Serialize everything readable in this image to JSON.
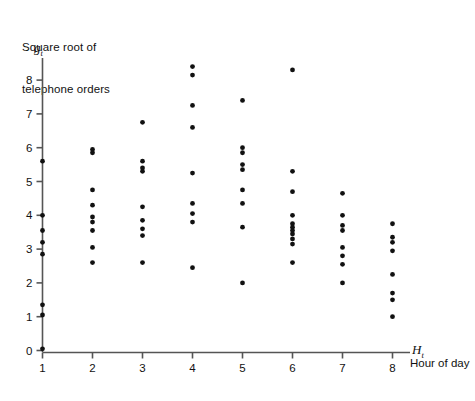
{
  "figure": {
    "ylabel_lines": [
      "Square root of",
      "telephone orders"
    ],
    "y_symbol": "g",
    "y_symbol_sub": "t",
    "x_symbol": "H",
    "x_symbol_sub": "t",
    "xlabel": "Hour of day",
    "point_color": "#111111",
    "axis_color": "#555555"
  },
  "chart_data": {
    "type": "scatter",
    "title": "",
    "xlabel": "Hour of day",
    "ylabel": "Square root of telephone orders",
    "x_symbol": "H_t",
    "y_symbol": "g_t",
    "xlim": [
      0.6,
      8.4
    ],
    "ylim": [
      0,
      8.8
    ],
    "xticks": [
      1,
      2,
      3,
      4,
      5,
      6,
      7,
      8
    ],
    "xticklabels": [
      "1",
      "2",
      "3",
      "4",
      "5",
      "6",
      "7",
      "8"
    ],
    "yticks": [
      0,
      1,
      2,
      3,
      4,
      5,
      6,
      7,
      8
    ],
    "yticklabels": [
      "0",
      "1",
      "2",
      "3",
      "4",
      "5",
      "6",
      "7",
      "8"
    ],
    "grid": false,
    "legend": false,
    "series": [
      {
        "name": "telephone orders",
        "x": [
          1,
          1,
          1,
          1,
          1,
          1,
          1,
          1,
          2,
          2,
          2,
          2,
          2,
          2,
          2,
          2,
          2,
          3,
          3,
          3,
          3,
          3,
          3,
          3,
          3,
          3,
          4,
          4,
          4,
          4,
          4,
          4,
          4,
          4,
          4,
          5,
          5,
          5,
          5,
          5,
          5,
          5,
          5,
          5,
          6,
          6,
          6,
          6,
          6,
          6,
          6,
          6,
          6,
          6,
          6,
          7,
          7,
          7,
          7,
          7,
          7,
          7,
          7,
          8,
          8,
          8,
          8,
          8,
          8,
          8,
          8
        ],
        "y": [
          5.6,
          4.0,
          3.55,
          3.2,
          2.85,
          1.35,
          1.05,
          0.05,
          5.95,
          5.85,
          4.75,
          4.3,
          3.95,
          3.8,
          3.55,
          3.05,
          2.6,
          6.75,
          5.6,
          5.4,
          5.3,
          4.25,
          3.85,
          3.6,
          3.4,
          2.6,
          8.4,
          8.15,
          7.25,
          6.6,
          5.25,
          4.35,
          4.05,
          3.8,
          2.45,
          2.0,
          7.4,
          6.0,
          5.85,
          5.5,
          5.35,
          4.75,
          4.35,
          3.65,
          2.6,
          8.3,
          5.3,
          4.7,
          4.0,
          3.75,
          3.65,
          3.55,
          3.45,
          3.3,
          3.15,
          2.0,
          4.65,
          4.0,
          3.7,
          3.55,
          3.05,
          2.8,
          2.55,
          2.25,
          3.75,
          3.35,
          3.2,
          2.95,
          1.7,
          1.5,
          1.0
        ]
      }
    ]
  }
}
